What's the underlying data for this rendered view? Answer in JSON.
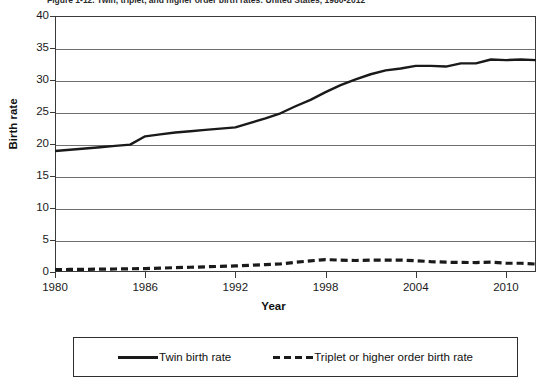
{
  "figure": {
    "caption": "Figure 1-12. Twin, triplet, and higher order birth rates: United States, 1980-2012",
    "caption_visible_note": "cropped"
  },
  "chart_data": {
    "type": "line",
    "title": "Figure 1-12. Twin, triplet, and higher order birth rates: United States, 1980-2012",
    "xlabel": "Year",
    "ylabel": "Birth rate",
    "xlim": [
      1980,
      2012
    ],
    "ylim": [
      0,
      40
    ],
    "ytick_values": [
      0,
      5,
      10,
      15,
      20,
      25,
      30,
      35,
      40
    ],
    "ytick_labels": [
      "0",
      "5",
      "10",
      "15",
      "20",
      "25",
      "30",
      "35",
      "40"
    ],
    "xtick_values": [
      1980,
      1986,
      1992,
      1998,
      2004,
      2010
    ],
    "xtick_labels": [
      "1980",
      "1986",
      "1992",
      "1998",
      "2004",
      "2010"
    ],
    "grid": true,
    "grid_axis": "y",
    "legend_position": "below",
    "x": [
      1980,
      1981,
      1982,
      1983,
      1984,
      1985,
      1986,
      1987,
      1988,
      1989,
      1990,
      1991,
      1992,
      1993,
      1994,
      1995,
      1996,
      1997,
      1998,
      1999,
      2000,
      2001,
      2002,
      2003,
      2004,
      2005,
      2006,
      2007,
      2008,
      2009,
      2010,
      2011,
      2012
    ],
    "series": [
      {
        "name": "Twin birth rate",
        "style": "solid",
        "color": "#1a1a1a",
        "values": [
          18.9,
          19.1,
          19.3,
          19.5,
          19.7,
          19.9,
          21.2,
          21.5,
          21.8,
          22.0,
          22.2,
          22.4,
          22.6,
          23.3,
          24.0,
          24.8,
          25.9,
          26.9,
          28.1,
          29.2,
          30.1,
          30.9,
          31.5,
          31.8,
          32.2,
          32.2,
          32.1,
          32.6,
          32.6,
          33.2,
          33.1,
          33.2,
          33.1
        ]
      },
      {
        "name": "Triplet or higher order birth rate",
        "style": "dashed",
        "color": "#1a1a1a",
        "values": [
          0.37,
          0.4,
          0.42,
          0.44,
          0.47,
          0.5,
          0.54,
          0.6,
          0.68,
          0.74,
          0.81,
          0.88,
          0.95,
          1.05,
          1.16,
          1.27,
          1.52,
          1.74,
          1.94,
          1.85,
          1.8,
          1.86,
          1.84,
          1.87,
          1.77,
          1.62,
          1.53,
          1.49,
          1.48,
          1.53,
          1.37,
          1.37,
          1.24
        ]
      }
    ]
  },
  "legend": {
    "items": [
      {
        "label": "Twin birth rate",
        "style": "solid"
      },
      {
        "label": "Triplet or higher order birth rate",
        "style": "dashed"
      }
    ]
  }
}
